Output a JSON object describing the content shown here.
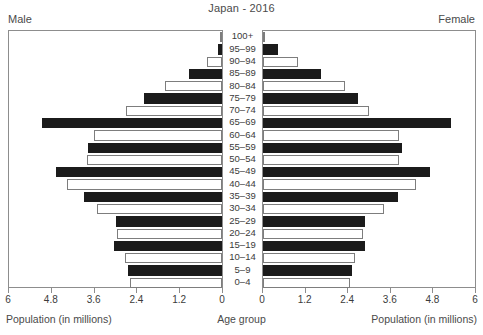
{
  "chart_data": {
    "type": "bar",
    "title": "Japan - 2016",
    "subtitle": "",
    "orientation": "horizontal",
    "layout": "population-pyramid",
    "xlabel": "Population (in millions)",
    "ylabel": "Age group",
    "xlim": [
      0,
      6
    ],
    "xticks": [
      0,
      1.2,
      2.4,
      3.6,
      4.8,
      6
    ],
    "xtick_labels_left": [
      "6",
      "4.8",
      "3.6",
      "2.4",
      "1.2",
      "0"
    ],
    "xtick_labels_right": [
      "0",
      "1.2",
      "2.4",
      "3.6",
      "4.8",
      "6"
    ],
    "grid": false,
    "legend": "none",
    "left_panel_label": "Male",
    "right_panel_label": "Female",
    "categories": [
      "100+",
      "95–99",
      "90–94",
      "85–89",
      "80–84",
      "75–79",
      "70–74",
      "65–69",
      "60–64",
      "55–59",
      "50–54",
      "45–49",
      "40–44",
      "35–39",
      "30–34",
      "25–29",
      "20–24",
      "15–19",
      "10–14",
      "5–9",
      "0–4"
    ],
    "series": [
      {
        "name": "Male",
        "side": "left",
        "values": [
          0.01,
          0.12,
          0.41,
          0.93,
          1.62,
          2.2,
          2.7,
          5.07,
          3.6,
          3.78,
          3.79,
          4.68,
          4.36,
          3.88,
          3.52,
          3.0,
          2.95,
          3.05,
          2.74,
          2.64,
          2.59
        ]
      },
      {
        "name": "Female",
        "side": "right",
        "values": [
          0.06,
          0.43,
          0.98,
          1.65,
          2.33,
          2.68,
          3.01,
          5.32,
          3.85,
          3.93,
          3.84,
          4.72,
          4.34,
          3.82,
          3.42,
          2.9,
          2.82,
          2.89,
          2.61,
          2.51,
          2.46
        ]
      }
    ],
    "bar_styles": {
      "filled_color": "#1b1b1b",
      "hollow_color": "#ffffff",
      "outline_color": "#7d7d7d",
      "pattern": "alternating rows: even index hollow, odd index filled"
    }
  },
  "captions": {
    "left": "Population (in millions)",
    "center": "Age group",
    "right": "Population (in millions)"
  }
}
